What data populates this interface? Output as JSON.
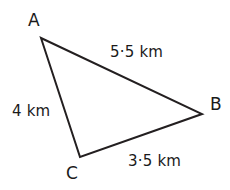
{
  "figure": {
    "type": "triangle-diagram",
    "background_color": "#ffffff",
    "stroke_color": "#231f20",
    "text_color": "#1a1a1a",
    "stroke_width": 2,
    "canvas": {
      "width": 230,
      "height": 190
    }
  },
  "vertices": [
    {
      "id": "A",
      "label": "A",
      "x": 41,
      "y": 38
    },
    {
      "id": "B",
      "label": "B",
      "x": 202,
      "y": 114
    },
    {
      "id": "C",
      "label": "C",
      "x": 80,
      "y": 157
    }
  ],
  "sides": [
    {
      "id": "AB",
      "from": "A",
      "to": "B",
      "label": "5·5 km",
      "value": 5.5,
      "unit": "km"
    },
    {
      "id": "AC",
      "from": "A",
      "to": "C",
      "label": "4 km",
      "value": 4,
      "unit": "km"
    },
    {
      "id": "CB",
      "from": "C",
      "to": "B",
      "label": "3·5 km",
      "value": 3.5,
      "unit": "km"
    }
  ],
  "chart_data": {
    "type": "diagram",
    "title": "",
    "shape": "triangle",
    "points": {
      "A": [
        41,
        38
      ],
      "B": [
        202,
        114
      ],
      "C": [
        80,
        157
      ]
    },
    "edge_labels": {
      "AB": "5·5 km",
      "AC": "4 km",
      "CB": "3·5 km"
    },
    "edge_values": {
      "AB": 5.5,
      "AC": 4,
      "CB": 3.5
    },
    "unit": "km"
  }
}
